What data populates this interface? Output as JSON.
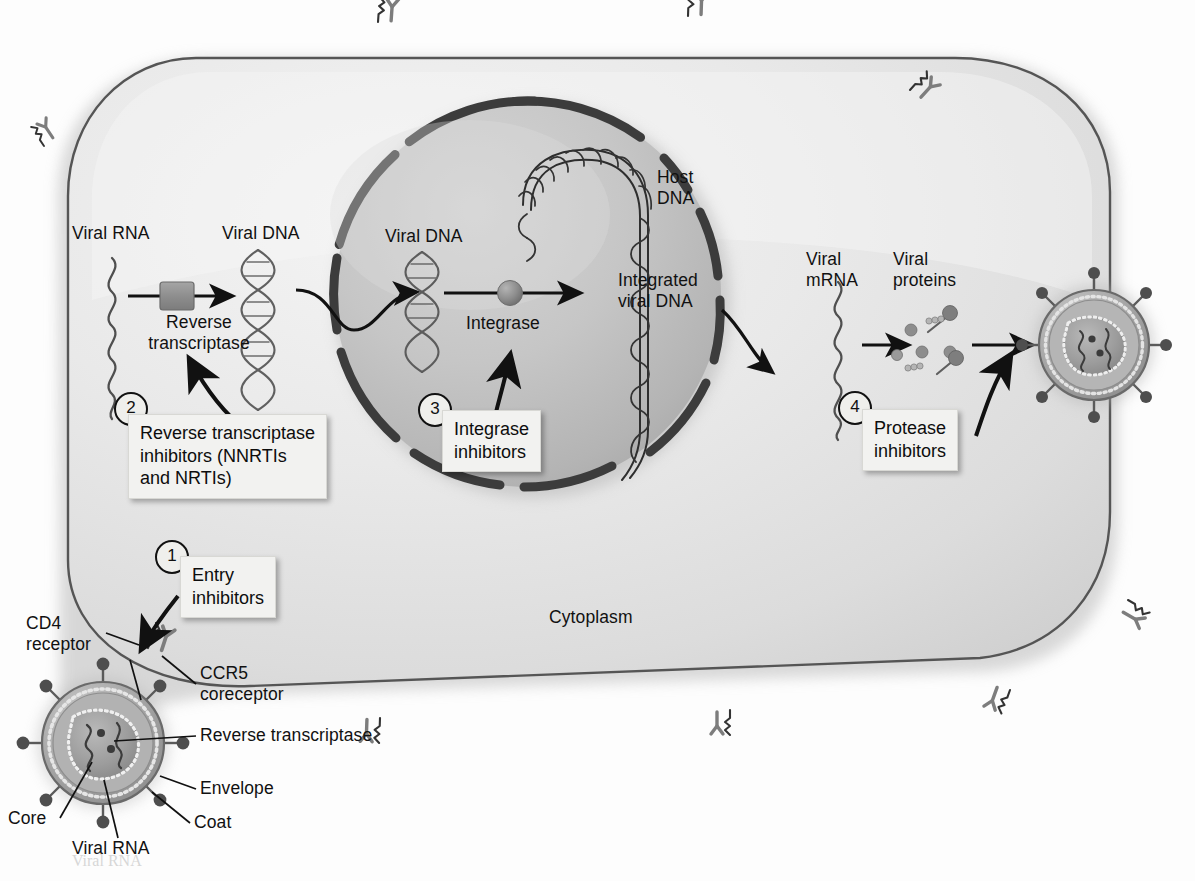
{
  "figure": {
    "cytoplasm_label": "Cytoplasm"
  },
  "colors": {
    "cell_fill_light": "#ebebeb",
    "cell_fill_shade": "#d2d2d2",
    "cell_outline": "#4a4a4a",
    "nucleus_fill": "#c9c9c9",
    "nucleus_fill_dark": "#a9a9a9",
    "nuclear_envelope": "#3a3a3a",
    "arrow": "#111111",
    "dna_stroke": "#4d4d4d",
    "host_dna_stroke": "#2b2b2b",
    "enzyme_fill": "#8e8e8e",
    "callout_bg": "#f2f2f0",
    "page_bg": "#ffffff",
    "virion_envelope": "#9a9a9a",
    "virion_core": "#8a8a8a"
  },
  "pathway_labels": {
    "viral_rna_cytoplasm": "Viral RNA",
    "viral_dna_cytoplasm": "Viral DNA",
    "viral_dna_nucleus": "Viral DNA",
    "host_dna": "Host\nDNA",
    "integrated_viral_dna": "Integrated\nviral DNA",
    "viral_mrna": "Viral\nmRNA",
    "viral_proteins": "Viral\nproteins"
  },
  "enzymes": {
    "reverse_transcriptase": "Reverse\ntranscriptase",
    "integrase": "Integrase"
  },
  "drug_steps": [
    {
      "number": "1",
      "label": "Entry\ninhibitors"
    },
    {
      "number": "2",
      "label": "Reverse transcriptase\ninhibitors (NNRTIs\nand NRTIs)"
    },
    {
      "number": "3",
      "label": "Integrase\ninhibitors"
    },
    {
      "number": "4",
      "label": "Protease\ninhibitors"
    }
  ],
  "virion_labels": {
    "cd4_receptor": "CD4\nreceptor",
    "ccr5_coreceptor": "CCR5\ncoreceptor",
    "reverse_transcriptase": "Reverse transcriptase",
    "envelope": "Envelope",
    "coat": "Coat",
    "core": "Core",
    "viral_rna": "Viral RNA"
  },
  "bleed_through": {
    "bottom_text": "Viral RNA"
  }
}
